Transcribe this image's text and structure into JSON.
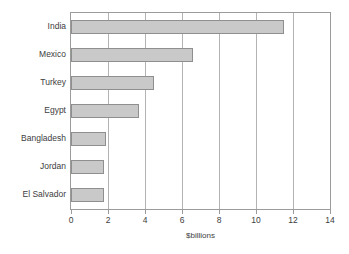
{
  "chart_data": {
    "type": "bar",
    "orientation": "horizontal",
    "title": "",
    "xlabel": "$billions",
    "ylabel": "",
    "categories": [
      "India",
      "Mexico",
      "Turkey",
      "Egypt",
      "Bangladesh",
      "Jordan",
      "El Salvador"
    ],
    "values": [
      11.5,
      6.6,
      4.5,
      3.7,
      1.9,
      1.8,
      1.8
    ],
    "xlim": [
      0,
      14
    ],
    "xticks": [
      0,
      2,
      4,
      6,
      8,
      10,
      12,
      14
    ],
    "xtick_labels": [
      "0",
      "2",
      "4",
      "6",
      "8",
      "10",
      "12",
      "14"
    ],
    "grid": "vertical",
    "legend": "none",
    "colors": {
      "bar_fill": "#c9c9c9",
      "bar_border": "#8f8f8f",
      "frame": "#9b9b9b",
      "gridline": "#b3b3b3",
      "text": "#3d3d3d",
      "background": "#ffffff"
    }
  }
}
